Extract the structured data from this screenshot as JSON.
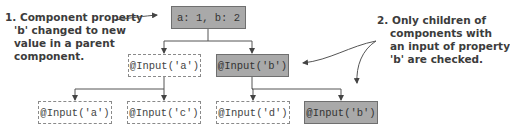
{
  "diagram": {
    "root": {
      "label": "a: 1, b: 2",
      "highlighted": true
    },
    "level2": [
      {
        "label": "@Input('a')",
        "highlighted": false
      },
      {
        "label": "@Input('b')",
        "highlighted": true
      }
    ],
    "level3": [
      {
        "label": "@Input('a')",
        "highlighted": false,
        "parent": 0
      },
      {
        "label": "@Input('c')",
        "highlighted": false,
        "parent": 0
      },
      {
        "label": "@Input('d')",
        "highlighted": false,
        "parent": 1
      },
      {
        "label": "@Input('b')",
        "highlighted": true,
        "parent": 1
      }
    ],
    "annotations": [
      {
        "lines": [
          "1. Component property",
          "'b' changed to new",
          "value in a parent",
          "component."
        ]
      },
      {
        "lines": [
          "2. Only children of",
          "components with",
          "an input of property",
          "'b' are checked."
        ]
      }
    ],
    "colors": {
      "highlight_fill": "#a9a9a9",
      "border": "#6f6f6f",
      "dashed_border": "#8a8a8a",
      "text": "#3c3c3c"
    }
  }
}
